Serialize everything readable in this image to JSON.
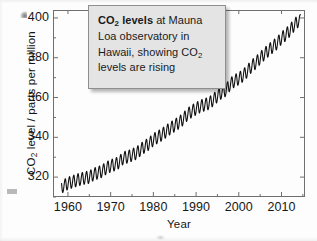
{
  "figure": {
    "caption": {
      "emphasis": "CO2 levels",
      "emphasis_display": "CO₂ levels",
      "rest": " at Mauna Loa observatory in Hawaii, showing CO₂ levels are rising",
      "full_text": "CO2 levels at Mauna Loa observatory in Hawaii, showing CO2 levels are rising",
      "background_color": "#e4e4e4",
      "border_color": "#8e8e8e"
    }
  },
  "chart_data": {
    "type": "line",
    "title": "",
    "subtitle": "",
    "xlabel": "Year",
    "ylabel": "CO2 level / parts per million",
    "ylabel_display": "CO₂ level / parts per million",
    "xlim": [
      1956.5,
      2015.5
    ],
    "ylim": [
      310,
      404
    ],
    "xticks": [
      1960,
      1970,
      1980,
      1990,
      2000,
      2010
    ],
    "yticks": [
      320,
      340,
      360,
      380,
      400
    ],
    "xtick_labels": [
      "1960",
      "1970",
      "1980",
      "1990",
      "2000",
      "2010"
    ],
    "ytick_labels": [
      "320",
      "340",
      "360",
      "380",
      "400"
    ],
    "minor_xtick_interval": 5,
    "minor_ytick_interval": 10,
    "grid": false,
    "legend": null,
    "line_color": "#111111",
    "axis_color": "#6f6f6f",
    "series": [
      {
        "name": "Monthly mean CO2 at Mauna Loa",
        "description": "Keeling curve: rising trend with annual seasonal oscillation of about 6 ppm peak-to-trough",
        "seasonal_amplitude_ppm": 3.1,
        "x": [
          1958.5,
          1959,
          1960,
          1961,
          1962,
          1963,
          1964,
          1965,
          1966,
          1967,
          1968,
          1969,
          1970,
          1971,
          1972,
          1973,
          1974,
          1975,
          1976,
          1977,
          1978,
          1979,
          1980,
          1981,
          1982,
          1983,
          1984,
          1985,
          1986,
          1987,
          1988,
          1989,
          1990,
          1991,
          1992,
          1993,
          1994,
          1995,
          1996,
          1997,
          1998,
          1999,
          2000,
          2001,
          2002,
          2003,
          2004,
          2005,
          2006,
          2007,
          2008,
          2009,
          2010,
          2011,
          2012,
          2013,
          2014
        ],
        "annual_mean": [
          315.0,
          315.6,
          316.9,
          317.6,
          318.4,
          319.0,
          319.6,
          320.0,
          321.4,
          322.2,
          323.0,
          324.6,
          325.7,
          326.3,
          327.5,
          329.7,
          330.2,
          331.1,
          332.0,
          333.8,
          335.4,
          336.8,
          338.8,
          340.1,
          341.4,
          343.0,
          344.6,
          346.0,
          347.4,
          349.2,
          351.6,
          353.1,
          354.4,
          355.6,
          356.4,
          357.1,
          358.8,
          360.8,
          362.6,
          363.7,
          366.7,
          368.4,
          369.5,
          371.1,
          373.2,
          375.8,
          377.5,
          379.8,
          381.9,
          383.8,
          385.6,
          387.4,
          389.9,
          391.6,
          393.8,
          396.5,
          398.6
        ]
      }
    ]
  }
}
